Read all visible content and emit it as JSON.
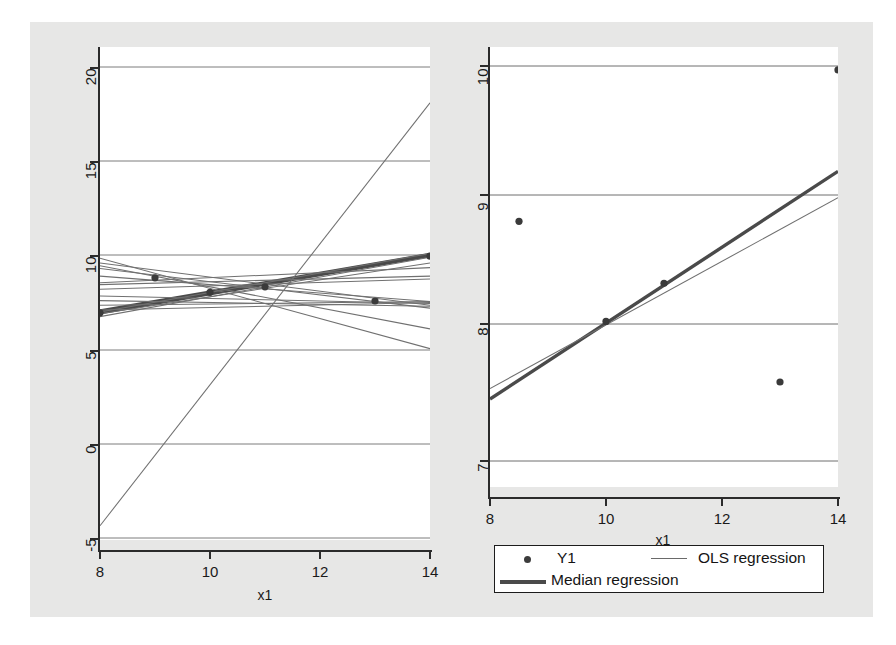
{
  "figure": {
    "background_color": "#e7e7e6",
    "panel_background": "#ffffff"
  },
  "chart_data": [
    {
      "type": "scatter",
      "panel": "left",
      "title": "",
      "xlabel": "x1",
      "ylabel": "",
      "xlim": [
        8,
        14
      ],
      "ylim": [
        -5,
        20
      ],
      "xticks": [
        8,
        10,
        12,
        14
      ],
      "xticklabels": [
        "8",
        "10",
        "12",
        "14"
      ],
      "yticks": [
        -5,
        0,
        5,
        10,
        15,
        20
      ],
      "yticklabels": [
        "-5",
        "0",
        "5",
        "10",
        "15",
        "20"
      ],
      "grid": "horizontal",
      "points": [
        {
          "x": 8,
          "y": 6.95
        },
        {
          "x": 9,
          "y": 8.81
        },
        {
          "x": 10,
          "y": 8.04
        },
        {
          "x": 11,
          "y": 8.33
        },
        {
          "x": 13,
          "y": 7.58
        },
        {
          "x": 14,
          "y": 9.96
        }
      ],
      "lines": [
        {
          "name": "median-regression",
          "style": "thick",
          "x0": 8,
          "y0": 6.95,
          "x1": 14,
          "y1": 10.0
        },
        {
          "name": "median-regression-b",
          "style": "thick",
          "x0": 8,
          "y0": 7.05,
          "x1": 14,
          "y1": 10.05
        },
        {
          "name": "ols-steep",
          "style": "thin",
          "x0": 8,
          "y0": -4.35,
          "x1": 14,
          "y1": 18.1
        },
        {
          "name": "ols-a",
          "style": "thin",
          "x0": 8,
          "y0": 9.6,
          "x1": 14,
          "y1": 7.35
        },
        {
          "name": "ols-b",
          "style": "thin",
          "x0": 8,
          "y0": 9.3,
          "x1": 14,
          "y1": 7.2
        },
        {
          "name": "ols-c",
          "style": "thin",
          "x0": 8,
          "y0": 8.9,
          "x1": 14,
          "y1": 7.55
        },
        {
          "name": "ols-d",
          "style": "thin",
          "x0": 8,
          "y0": 8.55,
          "x1": 14,
          "y1": 9.35
        },
        {
          "name": "ols-e",
          "style": "thin",
          "x0": 8,
          "y0": 8.45,
          "x1": 14,
          "y1": 8.9
        },
        {
          "name": "ols-f",
          "style": "thin",
          "x0": 8,
          "y0": 8.2,
          "x1": 14,
          "y1": 8.75
        },
        {
          "name": "ols-g",
          "style": "thin",
          "x0": 8,
          "y0": 7.85,
          "x1": 14,
          "y1": 7.45
        },
        {
          "name": "ols-h",
          "style": "thin",
          "x0": 8,
          "y0": 7.6,
          "x1": 14,
          "y1": 7.3
        },
        {
          "name": "ols-i",
          "style": "thin",
          "x0": 8,
          "y0": 7.35,
          "x1": 14,
          "y1": 7.55
        },
        {
          "name": "ols-j",
          "style": "thin",
          "x0": 8,
          "y0": 7.1,
          "x1": 14,
          "y1": 7.5
        },
        {
          "name": "ols-k",
          "style": "thin",
          "x0": 8,
          "y0": 6.75,
          "x1": 14,
          "y1": 9.9
        },
        {
          "name": "ols-l",
          "style": "thin",
          "x0": 8,
          "y0": 7.0,
          "x1": 14,
          "y1": 10.1
        },
        {
          "name": "ols-descend",
          "style": "thin",
          "x0": 8,
          "y0": 9.85,
          "x1": 14,
          "y1": 5.05
        },
        {
          "name": "ols-m",
          "style": "thin",
          "x0": 8,
          "y0": 9.45,
          "x1": 14,
          "y1": 6.1
        },
        {
          "name": "ols-n",
          "style": "thin",
          "x0": 8,
          "y0": 6.9,
          "x1": 14,
          "y1": 9.6
        }
      ]
    },
    {
      "type": "scatter",
      "panel": "right",
      "title": "",
      "xlabel": "x1",
      "ylabel": "",
      "xlim": [
        8,
        14
      ],
      "ylim": [
        6.72,
        10.13
      ],
      "xticks": [
        8,
        10,
        12,
        14
      ],
      "xticklabels": [
        "8",
        "10",
        "12",
        "14"
      ],
      "yticks": [
        7,
        8,
        9,
        10
      ],
      "yticklabels": [
        "7",
        "8",
        "9",
        "10"
      ],
      "grid": "horizontal",
      "points": [
        {
          "x": 8.5,
          "y": 8.82
        },
        {
          "x": 10,
          "y": 8.06
        },
        {
          "x": 11,
          "y": 8.35
        },
        {
          "x": 13,
          "y": 7.6
        },
        {
          "x": 14,
          "y": 9.97
        }
      ],
      "lines": [
        {
          "name": "median-regression",
          "style": "thick",
          "x0": 8,
          "y0": 7.47,
          "x1": 14,
          "y1": 9.2
        },
        {
          "name": "ols-regression",
          "style": "thin",
          "x0": 8,
          "y0": 7.55,
          "x1": 14,
          "y1": 9.0
        }
      ]
    }
  ],
  "legend": {
    "position": "bottom-right",
    "entries": [
      {
        "label": "Y1",
        "marker": "dot",
        "color": "#3c3c3c"
      },
      {
        "label": "OLS regression",
        "marker": "thin-line",
        "color": "#6a6a6a"
      },
      {
        "label": "Median regression",
        "marker": "thick-line",
        "color": "#4a4a4a"
      }
    ]
  },
  "axes": {
    "left": {
      "xlabel": "x1",
      "xticklabels": [
        "8",
        "10",
        "12",
        "14"
      ],
      "yticklabels": [
        "20",
        "15",
        "10",
        "5",
        "0",
        "-5"
      ]
    },
    "right": {
      "xlabel": "x1",
      "xticklabels": [
        "8",
        "10",
        "12",
        "14"
      ],
      "yticklabels": [
        "10",
        "9",
        "8",
        "7"
      ]
    }
  }
}
